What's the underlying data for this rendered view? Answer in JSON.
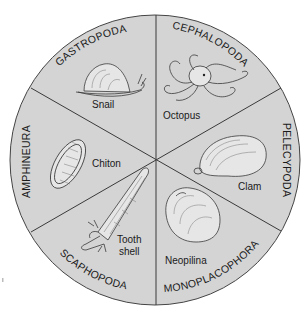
{
  "diagram": {
    "colors": {
      "page_background": "#ffffff",
      "circle_fill": "#d4d4d4",
      "divider_lines": "#3a3a3a",
      "text": "#1a1a1a"
    },
    "sectors": [
      {
        "class_name": "GASTROPODA",
        "example": "Snail"
      },
      {
        "class_name": "CEPHALOPODA",
        "example": "Octopus"
      },
      {
        "class_name": "PELECYPODA",
        "example": "Clam"
      },
      {
        "class_name": "MONOPLACOPHORA",
        "example": "Neopilina"
      },
      {
        "class_name": "SCAPHOPODA",
        "example": "Tooth shell",
        "example_lines": [
          "Tooth",
          "shell"
        ]
      },
      {
        "class_name": "AMPHINEURA",
        "example": "Chiton"
      }
    ]
  }
}
